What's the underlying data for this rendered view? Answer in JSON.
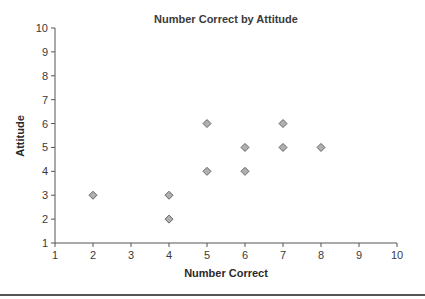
{
  "chart_data": {
    "type": "scatter",
    "title": "Number Correct by Attitude",
    "xlabel": "Number Correct",
    "ylabel": "Attitude",
    "xlim": [
      1,
      10
    ],
    "ylim": [
      1,
      10
    ],
    "xticks": [
      1,
      2,
      3,
      4,
      5,
      6,
      7,
      8,
      9,
      10
    ],
    "yticks": [
      1,
      2,
      3,
      4,
      5,
      6,
      7,
      8,
      9,
      10
    ],
    "grid": false,
    "legend": null,
    "marker": "diamond",
    "marker_color": "#b0b0b0",
    "marker_edge_color": "#666666",
    "series": [
      {
        "name": "Attitude",
        "points": [
          {
            "x": 2,
            "y": 3
          },
          {
            "x": 4,
            "y": 3
          },
          {
            "x": 4,
            "y": 2
          },
          {
            "x": 5,
            "y": 6
          },
          {
            "x": 5,
            "y": 4
          },
          {
            "x": 6,
            "y": 5
          },
          {
            "x": 6,
            "y": 4
          },
          {
            "x": 7,
            "y": 6
          },
          {
            "x": 7,
            "y": 5
          },
          {
            "x": 8,
            "y": 5
          }
        ]
      }
    ]
  }
}
